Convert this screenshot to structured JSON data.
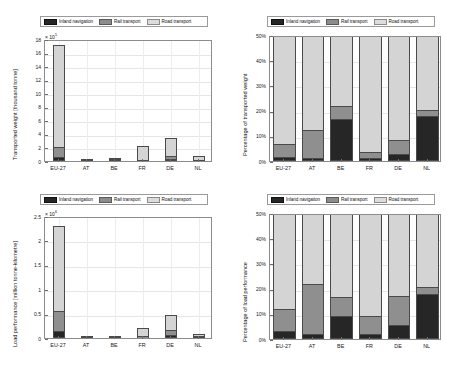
{
  "legend": {
    "items": [
      {
        "key": "inland",
        "label": "Inland navigation",
        "color": "#262626"
      },
      {
        "key": "rail",
        "label": "Rail transport",
        "color": "#8f8f8f"
      },
      {
        "key": "road",
        "label": "Road transport",
        "color": "#d4d4d4"
      }
    ]
  },
  "colors": {
    "inland_navigation": "#262626",
    "rail_transport": "#8f8f8f",
    "road_transport": "#d4d4d4",
    "axis": "#8c8c8c",
    "grid": "#e6e6e6"
  },
  "chart_data": [
    {
      "id": "transported-weight-absolute",
      "position": "top-left",
      "type": "bar",
      "stacked": true,
      "title": "",
      "xlabel": "",
      "ylabel": "Transported weight [thousand tonne]",
      "y_exponent_label": "× 10",
      "y_exponent_power": "5",
      "categories": [
        "EU-27",
        "AT",
        "BE",
        "FR",
        "DE",
        "NL"
      ],
      "yticks": [
        0,
        2,
        4,
        6,
        8,
        10,
        12,
        14,
        16,
        18
      ],
      "ytick_labels": [
        "0",
        "2",
        "4",
        "6",
        "8",
        "10",
        "12",
        "14",
        "16",
        "18"
      ],
      "ylim": [
        0,
        18
      ],
      "grid": true,
      "legend_position": "above-axes",
      "series": [
        {
          "name": "Inland navigation",
          "values": [
            0.62,
            0.04,
            0.17,
            0.09,
            0.23,
            0.15
          ]
        },
        {
          "name": "Rail transport",
          "values": [
            1.48,
            0.08,
            0.06,
            0.1,
            0.52,
            0.03
          ]
        },
        {
          "name": "Road transport",
          "values": [
            15.0,
            0.23,
            0.14,
            1.95,
            2.7,
            0.6
          ]
        }
      ],
      "totals": [
        17.1,
        0.35,
        0.37,
        2.14,
        3.45,
        0.78
      ]
    },
    {
      "id": "transported-weight-percentage",
      "position": "top-right",
      "type": "bar",
      "stacked": true,
      "title": "",
      "xlabel": "",
      "ylabel": "Percentage of transported weight",
      "categories": [
        "EU-27",
        "AT",
        "BE",
        "FR",
        "DE",
        "NL"
      ],
      "yticks": [
        0,
        10,
        20,
        30,
        40,
        50
      ],
      "ytick_labels": [
        "0%",
        "10%",
        "20%",
        "30%",
        "40%",
        "50%"
      ],
      "ylim": [
        0,
        50
      ],
      "grid": true,
      "legend_position": "above-axes",
      "series": [
        {
          "name": "Inland navigation",
          "values": [
            1.6,
            1.0,
            16.5,
            1.3,
            2.8,
            18.0
          ]
        },
        {
          "name": "Rail transport",
          "values": [
            5.1,
            11.5,
            5.5,
            2.3,
            5.5,
            2.2
          ]
        },
        {
          "name": "Road transport",
          "values": [
            93.3,
            87.5,
            78.0,
            96.4,
            91.7,
            79.8
          ]
        }
      ]
    },
    {
      "id": "load-performance-absolute",
      "position": "bottom-left",
      "type": "bar",
      "stacked": true,
      "title": "",
      "xlabel": "",
      "ylabel": "Load performance [million tonne-kilometre]",
      "y_exponent_label": "× 10",
      "y_exponent_power": "6",
      "categories": [
        "EU-27",
        "AT",
        "BE",
        "FR",
        "DE",
        "NL"
      ],
      "yticks": [
        0,
        0.5,
        1,
        1.5,
        2,
        2.5
      ],
      "ytick_labels": [
        "0",
        "0.5",
        "1",
        "1.5",
        "2",
        "2.5"
      ],
      "ylim": [
        0,
        2.5
      ],
      "grid": true,
      "legend_position": "above-axes",
      "series": [
        {
          "name": "Inland navigation",
          "values": [
            0.135,
            0.0015,
            0.009,
            0.008,
            0.055,
            0.04
          ]
        },
        {
          "name": "Rail transport",
          "values": [
            0.425,
            0.018,
            0.007,
            0.032,
            0.11,
            0.006
          ]
        },
        {
          "name": "Road transport",
          "values": [
            1.73,
            0.0255,
            0.018,
            0.17,
            0.31,
            0.043
          ]
        }
      ],
      "totals": [
        2.29,
        0.045,
        0.034,
        0.21,
        0.475,
        0.089
      ]
    },
    {
      "id": "load-performance-percentage",
      "position": "bottom-right",
      "type": "bar",
      "stacked": true,
      "title": "",
      "xlabel": "",
      "ylabel": "Percentage of load performance",
      "categories": [
        "EU-27",
        "AT",
        "BE",
        "FR",
        "DE",
        "NL"
      ],
      "yticks": [
        0,
        10,
        20,
        30,
        40,
        50
      ],
      "ytick_labels": [
        "0%",
        "10%",
        "20%",
        "30%",
        "40%",
        "50%"
      ],
      "ylim": [
        0,
        50
      ],
      "grid": true,
      "legend_position": "above-axes",
      "series": [
        {
          "name": "Inland navigation",
          "values": [
            3.2,
            2.0,
            9.2,
            1.9,
            5.5,
            18.0
          ]
        },
        {
          "name": "Rail transport",
          "values": [
            8.8,
            20.0,
            7.4,
            7.4,
            11.4,
            2.6
          ]
        },
        {
          "name": "Road transport",
          "values": [
            88.0,
            78.0,
            83.4,
            90.7,
            83.1,
            79.4
          ]
        }
      ]
    }
  ]
}
